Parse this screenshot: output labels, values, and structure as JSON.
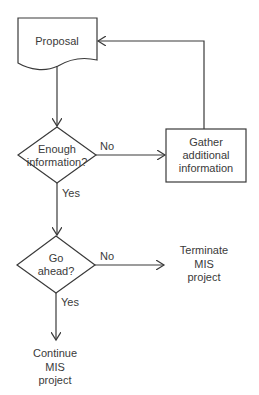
{
  "nodes": {
    "proposal": {
      "label": "Proposal",
      "type": "document"
    },
    "enough_info": {
      "label_line1": "Enough",
      "label_line2": "information?",
      "type": "decision"
    },
    "gather": {
      "label_line1": "Gather",
      "label_line2": "additional",
      "label_line3": "information",
      "type": "process"
    },
    "go_ahead": {
      "label_line1": "Go",
      "label_line2": "ahead?",
      "type": "decision"
    },
    "terminate": {
      "label_line1": "Terminate",
      "label_line2": "MIS",
      "label_line3": "project",
      "type": "terminal-text"
    },
    "continue": {
      "label_line1": "Continue",
      "label_line2": "MIS",
      "label_line3": "project",
      "type": "terminal-text"
    }
  },
  "edges": {
    "enough_no": {
      "label": "No"
    },
    "enough_yes": {
      "label": "Yes"
    },
    "go_no": {
      "label": "No"
    },
    "go_yes": {
      "label": "Yes"
    }
  }
}
